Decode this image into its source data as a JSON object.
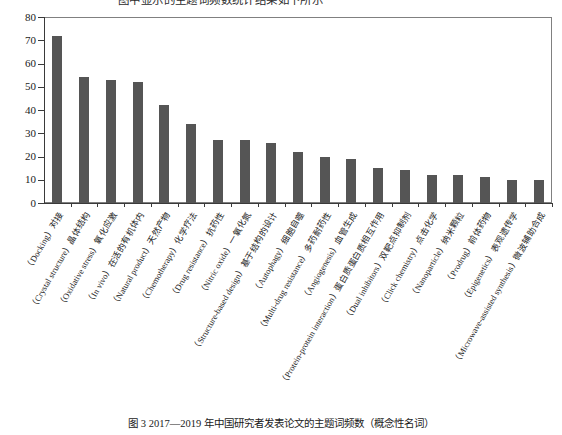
{
  "top_partial_text": "图中显示的主题词频数统计结果如下所示",
  "caption": "图 3   2017—2019 年中国研究者发表论文的主题词频数（概念性名词）",
  "chart_data": {
    "type": "bar",
    "title": "",
    "xlabel": "",
    "ylabel": "",
    "ylim": [
      0,
      80
    ],
    "yticks": [
      0,
      10,
      20,
      30,
      40,
      50,
      60,
      70,
      80
    ],
    "grid": false,
    "legend": false,
    "bar_color": "#555555",
    "axis_color": "#3a3a3a",
    "categories": [
      "（Docking）对接",
      "（Crystal structure）晶体结构",
      "（Oxidative stress）氧化应激",
      "（In vivo）在活的有机体内",
      "（Natural product）天然产物",
      "（Chemotherapy）化学疗法",
      "（Drug resistance）抗药性",
      "（Nitric oxide）一氧化氮",
      "（Structure-based design）基于结构的设计",
      "（Autophagy）细胞自噬",
      "（Multi-drug resistance）多药耐药性",
      "（Angiogenesis）血管生成",
      "（Protein-protein interaction）蛋白质蛋白质相互作用",
      "（Dual inhibitors）双靶点抑制剂",
      "（Click chemistry）点击化学",
      "（Nanoparticle）纳米颗粒",
      "（Prodrug）前体药物",
      "（Epigenetics）表观遗传学",
      "（Microwave-assisted synthesis）微波辅助合成"
    ],
    "values": [
      72,
      54,
      53,
      52,
      42,
      34,
      27,
      27,
      26,
      22,
      20,
      19,
      15,
      14,
      12,
      12,
      11,
      10,
      10
    ]
  }
}
